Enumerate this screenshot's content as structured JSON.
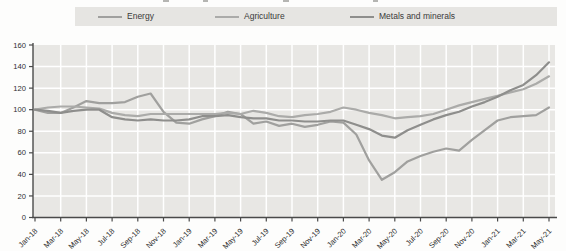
{
  "legend": {
    "items": [
      {
        "label": "Energy"
      },
      {
        "label": "Agriculture"
      },
      {
        "label": "Metals and minerals"
      }
    ]
  },
  "chart_data": {
    "type": "line",
    "title": "",
    "xlabel": "",
    "ylabel": "",
    "ylim": [
      0,
      160
    ],
    "ytick_step": 20,
    "ytick_labels": [
      "0",
      "20",
      "40",
      "60",
      "80",
      "100",
      "120",
      "140",
      "160"
    ],
    "x_tick_labels": [
      "Jan-18",
      "Mar-18",
      "May-18",
      "Jul-18",
      "Sep-18",
      "Nov-18",
      "Jan-19",
      "Mar-19",
      "May-19",
      "Jul-19",
      "Sep-19",
      "Nov-19",
      "Jan-20",
      "Mar-20",
      "May-20",
      "Jul-20",
      "Sep-20",
      "Nov-20",
      "Jan-21",
      "Mar-21",
      "May-21"
    ],
    "x": [
      "Jan-18",
      "Feb-18",
      "Mar-18",
      "Apr-18",
      "May-18",
      "Jun-18",
      "Jul-18",
      "Aug-18",
      "Sep-18",
      "Oct-18",
      "Nov-18",
      "Dec-18",
      "Jan-19",
      "Feb-19",
      "Mar-19",
      "Apr-19",
      "May-19",
      "Jun-19",
      "Jul-19",
      "Aug-19",
      "Sep-19",
      "Oct-19",
      "Nov-19",
      "Dec-19",
      "Jan-20",
      "Feb-20",
      "Mar-20",
      "Apr-20",
      "May-20",
      "Jun-20",
      "Jul-20",
      "Aug-20",
      "Sep-20",
      "Oct-20",
      "Nov-20",
      "Dec-20",
      "Jan-21",
      "Feb-21",
      "Mar-21",
      "Apr-21",
      "May-21"
    ],
    "series": [
      {
        "name": "Energy",
        "color": "#a0a09e",
        "values": [
          100,
          97,
          97,
          102,
          108,
          106,
          106,
          107,
          112,
          115,
          98,
          88,
          87,
          91,
          94,
          98,
          96,
          87,
          89,
          85,
          87,
          84,
          86,
          89,
          88,
          77,
          53,
          35,
          42,
          52,
          57,
          61,
          64,
          62,
          72,
          81,
          90,
          93,
          94,
          95,
          102
        ]
      },
      {
        "name": "Agriculture",
        "color": "#ababa9",
        "values": [
          100,
          102,
          103,
          103,
          102,
          101,
          97,
          95,
          94,
          96,
          96,
          96,
          96,
          96,
          96,
          97,
          96,
          99,
          97,
          94,
          93,
          95,
          96,
          98,
          102,
          100,
          97,
          95,
          92,
          93,
          94,
          96,
          100,
          104,
          107,
          110,
          113,
          116,
          119,
          124,
          131
        ]
      },
      {
        "name": "Metals and minerals",
        "color": "#8e8e8c",
        "values": [
          100,
          99,
          97,
          99,
          100,
          100,
          93,
          91,
          90,
          91,
          90,
          90,
          91,
          94,
          94,
          95,
          93,
          92,
          92,
          90,
          90,
          89,
          89,
          90,
          90,
          86,
          82,
          76,
          74,
          81,
          86,
          91,
          95,
          98,
          103,
          107,
          112,
          118,
          123,
          132,
          144
        ]
      }
    ],
    "grid": true,
    "legend_position": "top",
    "plot_bg_color": "#e8e7e4",
    "grid_color": "#ffffff",
    "axis_color": "#4a4a4a",
    "tick_label_color": "#2e2e2e"
  }
}
